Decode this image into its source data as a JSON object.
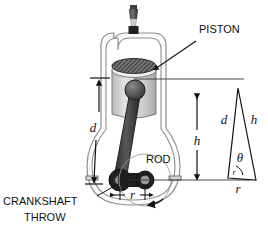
{
  "figure": {
    "background_color": "#ffffff",
    "line_color": "#1a1a1a"
  },
  "labels": {
    "piston": "PISTON",
    "rod": "ROD",
    "crankshaft_throw_line1": "CRANKSHAFT",
    "crankshaft_throw_line2": "THROW"
  },
  "dimensions": {
    "d_left": "d",
    "h_right": "h",
    "r_crank": "r"
  },
  "triangle": {
    "side_left": "d",
    "side_right": "h",
    "angle": "θ",
    "base": "r",
    "arc_label": "r"
  },
  "colors": {
    "rod_fill": "#3a3a3a",
    "piston_body": "#c9c9c9",
    "piston_top": "#555555",
    "housing_fill": "#f2f2f2",
    "sparkplug": "#4a4a4a"
  }
}
